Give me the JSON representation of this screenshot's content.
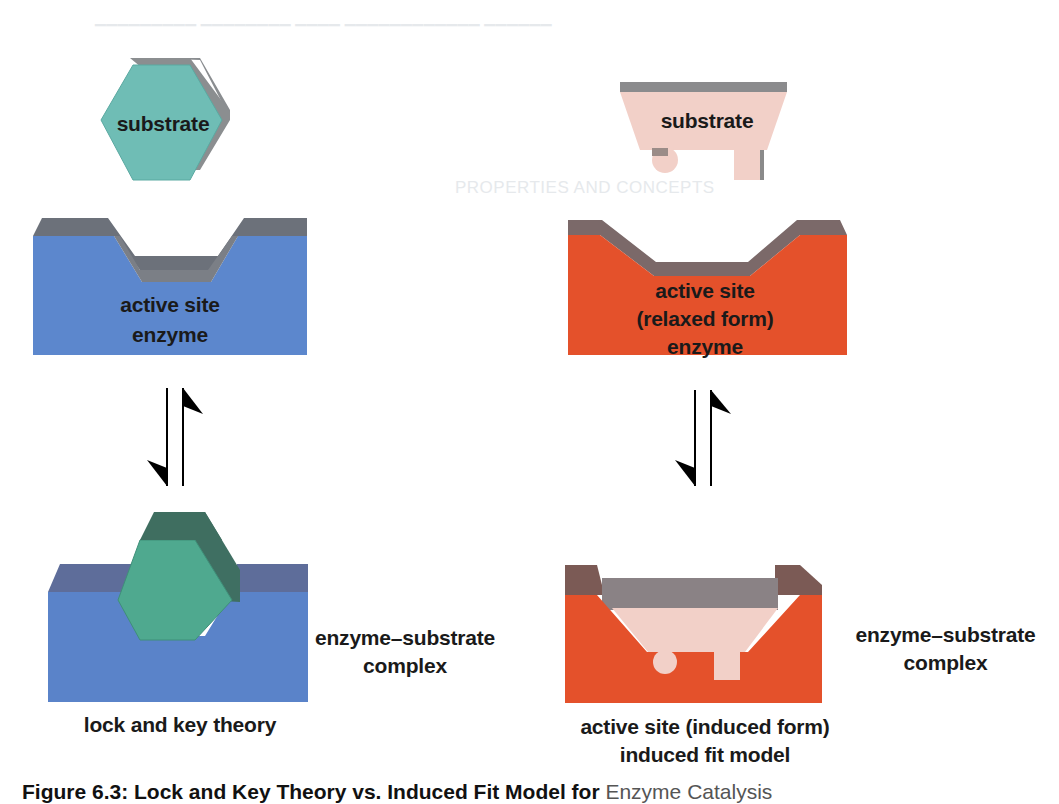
{
  "figure": {
    "caption_prefix": "Figure 6.3: Lock and Key Theory vs. Induced Fit Model for",
    "caption_suffix": "Enzyme Catalysis"
  },
  "lock_and_key": {
    "substrate_label": "substrate",
    "enzyme_active_site_label": "active site",
    "enzyme_label": "enzyme",
    "complex_label_line1": "enzyme–substrate",
    "complex_label_line2": "complex",
    "model_label": "lock and key theory",
    "colors": {
      "substrate": "#6dbcb4",
      "substrate_bound": "#4fa88e",
      "enzyme": "#5b86cc",
      "enzyme_top": "#6b6f78"
    }
  },
  "induced_fit": {
    "substrate_label": "substrate",
    "enzyme_active_site_label": "active site",
    "enzyme_form_label": "(relaxed form)",
    "enzyme_label": "enzyme",
    "complex_label_line1": "enzyme–substrate",
    "complex_label_line2": "complex",
    "induced_label": "active site (induced form)",
    "model_label": "induced fit model",
    "colors": {
      "substrate": "#f2cfc6",
      "enzyme": "#e4502a",
      "enzyme_top": "#7a6a68"
    }
  },
  "arrows": {
    "type": "equilibrium-harpoons"
  },
  "background_bleed": {
    "heading": "PROPERTIES AND CONCEPTS"
  }
}
